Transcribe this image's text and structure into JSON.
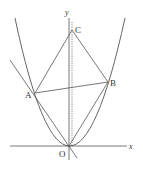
{
  "diagram": {
    "type": "coordinate-geometry",
    "labels": {
      "x_axis": "x",
      "y_axis": "y",
      "origin": "O",
      "point_a": "A",
      "point_b": "B",
      "point_c": "C"
    },
    "colors": {
      "stroke": "#555555",
      "text": "#333333",
      "background": "#ffffff"
    }
  }
}
